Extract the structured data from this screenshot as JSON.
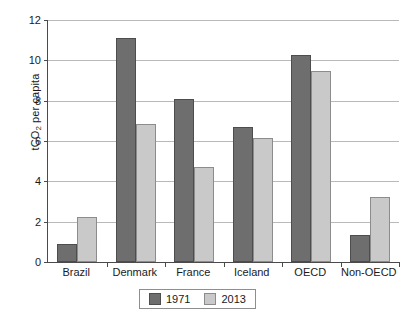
{
  "chart_data": {
    "type": "bar",
    "title": "",
    "xlabel": "",
    "ylabel": "tCO2 per capita",
    "ylabel_prefix": "tCO",
    "ylabel_sub": "2",
    "ylabel_suffix": " per capita",
    "categories": [
      "Brazil",
      "Denmark",
      "France",
      "Iceland",
      "OECD",
      "Non-OECD"
    ],
    "series": [
      {
        "name": "1971",
        "color": "#6e6e6e",
        "values": [
          0.9,
          11.1,
          8.1,
          6.7,
          10.25,
          1.35
        ]
      },
      {
        "name": "2013",
        "color": "#c9c9c9",
        "values": [
          2.25,
          6.85,
          4.7,
          6.15,
          9.45,
          3.2
        ]
      }
    ],
    "ylim": [
      0,
      12
    ],
    "ytick_values": [
      0,
      2,
      4,
      6,
      8,
      10,
      12
    ],
    "ytick_labels": [
      "0",
      "2",
      "4",
      "6",
      "8",
      "10",
      "12"
    ],
    "grid": true,
    "grid_axis": "y",
    "legend_position": "bottom-center",
    "legend_entries": [
      "1971",
      "2013"
    ]
  },
  "colors": {
    "series_1971": "#6e6e6e",
    "series_2013": "#c9c9c9",
    "gridline": "#b9b9b9",
    "axis": "#4a4a4a",
    "background": "#ffffff",
    "text": "#1a1a1a"
  }
}
